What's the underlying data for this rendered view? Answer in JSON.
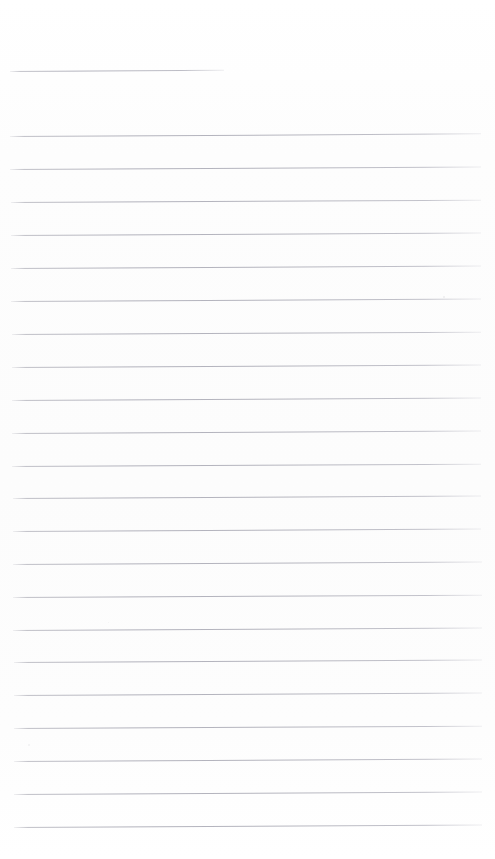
{
  "page": {
    "kind": "lined-paper",
    "width": 495,
    "height": 859,
    "background_color": "#fdfdfd",
    "rule_color": "#b4b4be",
    "has_text_content": false,
    "written_content": "",
    "margin_left": 10,
    "margin_right": 481
  },
  "rules": {
    "short_line": {
      "name": "top-short-rule",
      "y": 71,
      "x_start": 10,
      "x_end": 224,
      "slant_deg": -0.35
    },
    "line_spacing": 32.7,
    "first_full_line_y": 136,
    "full_line_count": 22,
    "full_lines": [
      {
        "y": 136,
        "x_start": 10,
        "x_end": 481,
        "slant_deg": -0.32
      },
      {
        "y": 169,
        "x_start": 10,
        "x_end": 481,
        "slant_deg": -0.3
      },
      {
        "y": 202,
        "x_start": 11,
        "x_end": 481,
        "slant_deg": -0.28
      },
      {
        "y": 235,
        "x_start": 11,
        "x_end": 481,
        "slant_deg": -0.3
      },
      {
        "y": 268,
        "x_start": 11,
        "x_end": 481,
        "slant_deg": -0.32
      },
      {
        "y": 301,
        "x_start": 11,
        "x_end": 481,
        "slant_deg": -0.3
      },
      {
        "y": 334,
        "x_start": 12,
        "x_end": 481,
        "slant_deg": -0.28
      },
      {
        "y": 367,
        "x_start": 12,
        "x_end": 481,
        "slant_deg": -0.3
      },
      {
        "y": 400,
        "x_start": 12,
        "x_end": 481,
        "slant_deg": -0.32
      },
      {
        "y": 433,
        "x_start": 12,
        "x_end": 481,
        "slant_deg": -0.3
      },
      {
        "y": 466,
        "x_start": 12,
        "x_end": 481,
        "slant_deg": -0.28
      },
      {
        "y": 498,
        "x_start": 13,
        "x_end": 481,
        "slant_deg": -0.3
      },
      {
        "y": 531,
        "x_start": 13,
        "x_end": 481,
        "slant_deg": -0.32
      },
      {
        "y": 564,
        "x_start": 13,
        "x_end": 482,
        "slant_deg": -0.3
      },
      {
        "y": 597,
        "x_start": 13,
        "x_end": 482,
        "slant_deg": -0.28
      },
      {
        "y": 630,
        "x_start": 13,
        "x_end": 482,
        "slant_deg": -0.3
      },
      {
        "y": 662,
        "x_start": 14,
        "x_end": 482,
        "slant_deg": -0.32
      },
      {
        "y": 695,
        "x_start": 14,
        "x_end": 482,
        "slant_deg": -0.3
      },
      {
        "y": 728,
        "x_start": 14,
        "x_end": 482,
        "slant_deg": -0.28
      },
      {
        "y": 761,
        "x_start": 14,
        "x_end": 482,
        "slant_deg": -0.3
      },
      {
        "y": 794,
        "x_start": 14,
        "x_end": 482,
        "slant_deg": -0.32
      },
      {
        "y": 827,
        "x_start": 14,
        "x_end": 482,
        "slant_deg": -0.3
      }
    ]
  },
  "specks": [
    {
      "name": "scan-speck-right",
      "x": 443,
      "y": 296,
      "size": 2.0,
      "opacity": 0.5
    },
    {
      "name": "scan-speck-left",
      "x": 28,
      "y": 744,
      "size": 1.6,
      "opacity": 0.35
    },
    {
      "name": "scan-speck-mid",
      "x": 108,
      "y": 622,
      "size": 1.4,
      "opacity": 0.3
    }
  ]
}
